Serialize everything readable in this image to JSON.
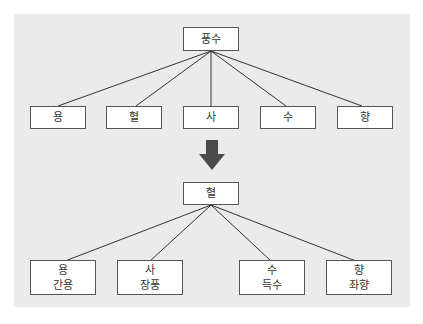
{
  "diagram": {
    "top_root": {
      "label": "풍수"
    },
    "top_children": [
      {
        "label": "용"
      },
      {
        "label": "혈"
      },
      {
        "label": "사"
      },
      {
        "label": "수"
      },
      {
        "label": "향"
      }
    ],
    "arrow": {
      "direction": "down",
      "icon": "down-arrow-icon"
    },
    "bottom_root": {
      "label": "혈"
    },
    "bottom_children": [
      {
        "label": "용",
        "sublabel": "간용"
      },
      {
        "label": "사",
        "sublabel": "장풍"
      },
      {
        "label": "수",
        "sublabel": "득수"
      },
      {
        "label": "향",
        "sublabel": "좌향"
      }
    ],
    "colors": {
      "panel": "#ebebeb",
      "box_border": "#555555",
      "arrow": "#4a4a4a"
    }
  }
}
